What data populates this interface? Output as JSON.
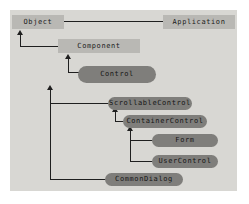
{
  "diagram": {
    "canvas": {
      "background_color": "#d8d7d3",
      "page_background_color": "#ffffff"
    },
    "colors": {
      "rect_node_fill": "#b9b8b4",
      "pill_node_fill": "#7f7e7b",
      "connector": "#1f1f1f",
      "text": "#1a1a1a"
    },
    "nodes": [
      {
        "id": "object",
        "label": "Object",
        "shape": "rect",
        "x": 12,
        "y": 15,
        "w": 52,
        "h": 14
      },
      {
        "id": "application",
        "label": "Application",
        "shape": "rect",
        "x": 163,
        "y": 15,
        "w": 72,
        "h": 14
      },
      {
        "id": "component",
        "label": "Component",
        "shape": "rect",
        "x": 58,
        "y": 39,
        "w": 82,
        "h": 14
      },
      {
        "id": "control",
        "label": "Control",
        "shape": "pill",
        "x": 78,
        "y": 66,
        "w": 78,
        "h": 17
      },
      {
        "id": "scrollablecontrol",
        "label": "ScrollableControl",
        "shape": "pill",
        "x": 108,
        "y": 97,
        "w": 84,
        "h": 13
      },
      {
        "id": "containercontrol",
        "label": "ContainerControl",
        "shape": "pill",
        "x": 123,
        "y": 115,
        "w": 84,
        "h": 13
      },
      {
        "id": "form",
        "label": "Form",
        "shape": "pill",
        "x": 152,
        "y": 134,
        "w": 66,
        "h": 13
      },
      {
        "id": "usercontrol",
        "label": "UserControl",
        "shape": "pill",
        "x": 152,
        "y": 155,
        "w": 66,
        "h": 13
      },
      {
        "id": "commondialog",
        "label": "CommonDialog",
        "shape": "pill",
        "x": 105,
        "y": 173,
        "w": 78,
        "h": 13
      }
    ],
    "edges": [
      {
        "id": "application-to-object",
        "from": "application",
        "to": "object",
        "arrow": "left"
      },
      {
        "id": "component-to-object",
        "from": "component",
        "to": "object",
        "arrow": "up"
      },
      {
        "id": "control-to-component",
        "from": "control",
        "to": "component",
        "arrow": "up"
      },
      {
        "id": "scrollablecontrol-to-control",
        "from": "scrollablecontrol",
        "to": "control",
        "arrow": "up"
      },
      {
        "id": "containercontrol-to-scrollablecontrol",
        "from": "containercontrol",
        "to": "scrollablecontrol",
        "arrow": "up"
      },
      {
        "id": "form-to-containercontrol",
        "from": "form",
        "to": "containercontrol",
        "arrow": "up"
      },
      {
        "id": "usercontrol-to-containercontrol",
        "from": "usercontrol",
        "to": "containercontrol",
        "arrow": "up"
      },
      {
        "id": "commondialog-to-control",
        "from": "commondialog",
        "to": "control",
        "arrow": "up"
      }
    ]
  }
}
